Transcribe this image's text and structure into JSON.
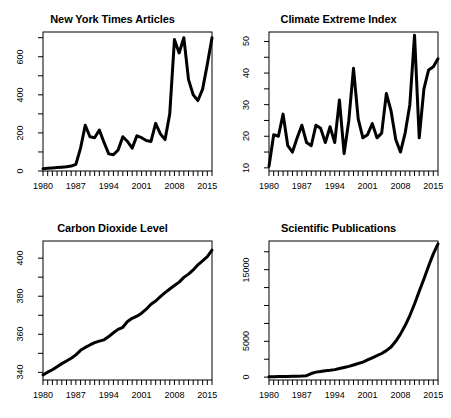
{
  "figure": {
    "background_color": "#ffffff",
    "line_color": "#000000",
    "axis_color": "#000000",
    "layout": "2x2 grid of line plots"
  },
  "chart_data": [
    {
      "type": "line",
      "title": "New York Times Articles",
      "xlabel": "",
      "ylabel": "",
      "xlim": [
        1980,
        2016
      ],
      "ylim": [
        0,
        730
      ],
      "grid": false,
      "legend": null,
      "xticks": [
        1980,
        1987,
        1994,
        2001,
        2008,
        2015
      ],
      "yticks": [
        0,
        200,
        400,
        600
      ],
      "minor_xticks": "annual",
      "x": [
        1980,
        1981,
        1982,
        1983,
        1984,
        1985,
        1986,
        1987,
        1988,
        1989,
        1990,
        1991,
        1992,
        1993,
        1994,
        1995,
        1996,
        1997,
        1998,
        1999,
        2000,
        2001,
        2002,
        2003,
        2004,
        2005,
        2006,
        2007,
        2008,
        2009,
        2010,
        2011,
        2012,
        2013,
        2014,
        2015,
        2016
      ],
      "values": [
        12,
        14,
        16,
        18,
        20,
        22,
        26,
        35,
        120,
        240,
        180,
        175,
        215,
        150,
        90,
        85,
        110,
        180,
        155,
        120,
        185,
        175,
        160,
        155,
        250,
        195,
        165,
        300,
        690,
        620,
        700,
        480,
        400,
        370,
        430,
        560,
        700
      ]
    },
    {
      "type": "line",
      "title": "Climate Extreme Index",
      "xlabel": "",
      "ylabel": "",
      "xlim": [
        1980,
        2016
      ],
      "ylim": [
        9,
        53
      ],
      "grid": false,
      "legend": null,
      "xticks": [
        1980,
        1987,
        1994,
        2001,
        2008,
        2015
      ],
      "yticks": [
        10,
        20,
        30,
        40,
        50
      ],
      "minor_xticks": "annual",
      "x": [
        1980,
        1981,
        1982,
        1983,
        1984,
        1985,
        1986,
        1987,
        1988,
        1989,
        1990,
        1991,
        1992,
        1993,
        1994,
        1995,
        1996,
        1997,
        1998,
        1999,
        2000,
        2001,
        2002,
        2003,
        2004,
        2005,
        2006,
        2007,
        2008,
        2009,
        2010,
        2011,
        2012,
        2013,
        2014,
        2015,
        2016
      ],
      "values": [
        10.5,
        20.5,
        20.0,
        27.0,
        17.0,
        15.0,
        19.5,
        23.5,
        18.0,
        17.0,
        23.5,
        22.5,
        18.0,
        23.0,
        18.0,
        31.5,
        14.5,
        25.0,
        41.5,
        25.5,
        19.5,
        20.5,
        24.0,
        19.5,
        21.0,
        33.5,
        28.0,
        19.0,
        15.0,
        21.0,
        30.0,
        52.0,
        19.5,
        35.0,
        41.0,
        42.0,
        44.5
      ]
    },
    {
      "type": "line",
      "title": "Carbon Dioxide Level",
      "xlabel": "",
      "ylabel": "",
      "xlim": [
        1980,
        2016
      ],
      "ylim": [
        336,
        409
      ],
      "grid": false,
      "legend": null,
      "xticks": [
        1980,
        1987,
        1994,
        2001,
        2008,
        2015
      ],
      "yticks": [
        340,
        360,
        380,
        400
      ],
      "minor_xticks": "annual",
      "x": [
        1980,
        1981,
        1982,
        1983,
        1984,
        1985,
        1986,
        1987,
        1988,
        1989,
        1990,
        1991,
        1992,
        1993,
        1994,
        1995,
        1996,
        1997,
        1998,
        1999,
        2000,
        2001,
        2002,
        2003,
        2004,
        2005,
        2006,
        2007,
        2008,
        2009,
        2010,
        2011,
        2012,
        2013,
        2014,
        2015,
        2016
      ],
      "values": [
        338.7,
        340.1,
        341.4,
        343.0,
        344.6,
        346.0,
        347.4,
        349.2,
        351.6,
        353.1,
        354.4,
        355.6,
        356.4,
        357.1,
        358.8,
        360.8,
        362.6,
        363.7,
        366.7,
        368.4,
        369.5,
        371.1,
        373.2,
        375.8,
        377.5,
        379.8,
        381.9,
        383.8,
        385.6,
        387.4,
        389.9,
        391.6,
        393.8,
        396.5,
        398.6,
        400.8,
        404.2
      ]
    },
    {
      "type": "line",
      "title": "Scientific Publications",
      "xlabel": "",
      "ylabel": "",
      "xlim": [
        1980,
        2016
      ],
      "ylim": [
        -400,
        19000
      ],
      "grid": false,
      "legend": null,
      "xticks": [
        1980,
        1987,
        1994,
        2001,
        2008,
        2015
      ],
      "yticks": [
        0,
        5000,
        10000,
        15000
      ],
      "ytick_labels": [
        "0",
        "5000",
        "",
        "15000"
      ],
      "minor_xticks": "annual",
      "x": [
        1980,
        1981,
        1982,
        1983,
        1984,
        1985,
        1986,
        1987,
        1988,
        1989,
        1990,
        1991,
        1992,
        1993,
        1994,
        1995,
        1996,
        1997,
        1998,
        1999,
        2000,
        2001,
        2002,
        2003,
        2004,
        2005,
        2006,
        2007,
        2008,
        2009,
        2010,
        2011,
        2012,
        2013,
        2014,
        2015,
        2016
      ],
      "values": [
        60,
        70,
        80,
        90,
        100,
        110,
        130,
        150,
        200,
        500,
        700,
        800,
        900,
        950,
        1050,
        1200,
        1350,
        1500,
        1700,
        1900,
        2100,
        2400,
        2700,
        3000,
        3300,
        3700,
        4200,
        5000,
        6000,
        7200,
        8600,
        10200,
        12000,
        13700,
        15500,
        17200,
        18600
      ]
    }
  ]
}
